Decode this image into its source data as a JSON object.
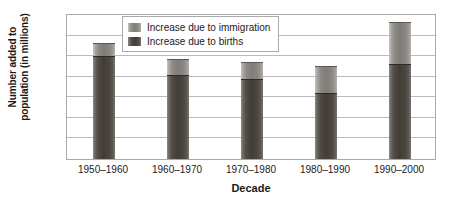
{
  "chart_data": {
    "type": "bar",
    "subtype": "stacked-bar",
    "title": "",
    "xlabel": "Decade",
    "ylabel": "Number added to population (in millions)",
    "ylabel_lines": [
      "Number added to",
      "population (in millions)"
    ],
    "categories": [
      "1950–1960",
      "1960–1970",
      "1970–1980",
      "1980–1990",
      "1990–2000"
    ],
    "series": [
      {
        "name": "Increase due to births",
        "values": [
          25.0,
          20.5,
          19.4,
          16.0,
          23.1
        ],
        "color": "#423d38"
      },
      {
        "name": "Increase due to immigration",
        "values": [
          3.2,
          3.8,
          4.1,
          6.5,
          10.2
        ],
        "color": "#807c77"
      }
    ],
    "totals": [
      28.2,
      24.3,
      23.5,
      22.5,
      33.3
    ],
    "ylim": [
      0,
      35
    ],
    "ytick_values": [
      0,
      5,
      10,
      15,
      20,
      25,
      30,
      35
    ],
    "ytick_labels": [
      "0",
      "5",
      "10",
      "15",
      "20",
      "25",
      "30",
      "35"
    ],
    "grid": "horizontal",
    "legend_position": "top-center-inside",
    "legend_entries": [
      "Increase due to immigration",
      "Increase due to births"
    ],
    "stack_order_bottom_to_top": [
      "Increase due to births",
      "Increase due to immigration"
    ]
  },
  "legend": {
    "rows": [
      {
        "label": "Increase due to immigration",
        "swatch": "immigration-swatch"
      },
      {
        "label": "Increase due to births",
        "swatch": "births-swatch"
      }
    ]
  },
  "axes": {
    "x_title": "Decade",
    "y_title_line1": "Number added to",
    "y_title_line2": "population (in millions)"
  }
}
